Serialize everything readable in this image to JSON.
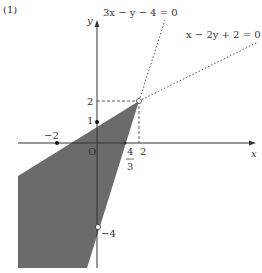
{
  "problem_label": "(1)",
  "axes": {
    "x_label": "x",
    "y_label": "y",
    "origin_label": "O"
  },
  "lines": [
    {
      "equation": "3x − y − 4 = 0",
      "style": "dotted"
    },
    {
      "equation": "x − 2y + 2 = 0",
      "style": "dotted"
    }
  ],
  "tick_labels": {
    "x_neg2": "−2",
    "x_four_thirds_num": "4",
    "x_four_thirds_den": "3",
    "x_2": "2",
    "y_1": "1",
    "y_2": "2",
    "y_neg4": "−4"
  },
  "region": {
    "fill": "#6b6b6b",
    "description": "shaded feasible region below both lines"
  }
}
